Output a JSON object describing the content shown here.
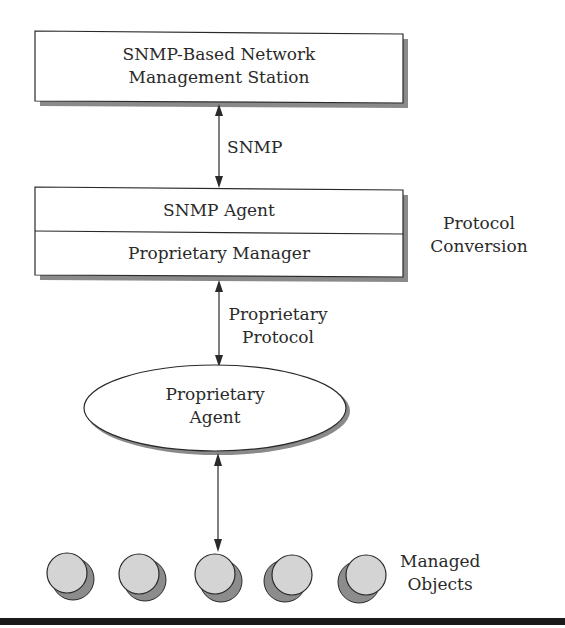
{
  "diagram": {
    "nms_box": {
      "line1": "SNMP-Based Network",
      "line2": "Management Station"
    },
    "snmp_link_label": "SNMP",
    "conversion_box": {
      "top_label": "SNMP Agent",
      "bottom_label": "Proprietary Manager"
    },
    "conversion_side_label": {
      "line1": "Protocol",
      "line2": "Conversion"
    },
    "proprietary_link_label": {
      "line1": "Proprietary",
      "line2": "Protocol"
    },
    "agent_ellipse": {
      "line1": "Proprietary",
      "line2": "Agent"
    },
    "managed_objects_label": {
      "line1": "Managed",
      "line2": "Objects"
    },
    "managed_objects_count": 5,
    "colors": {
      "stroke": "#2a2a2a",
      "shadow": "#8a8a8a",
      "object_fill": "#d4d4d4",
      "object_shadow": "#8c8c8c",
      "rule": "#1a1a1a"
    }
  }
}
